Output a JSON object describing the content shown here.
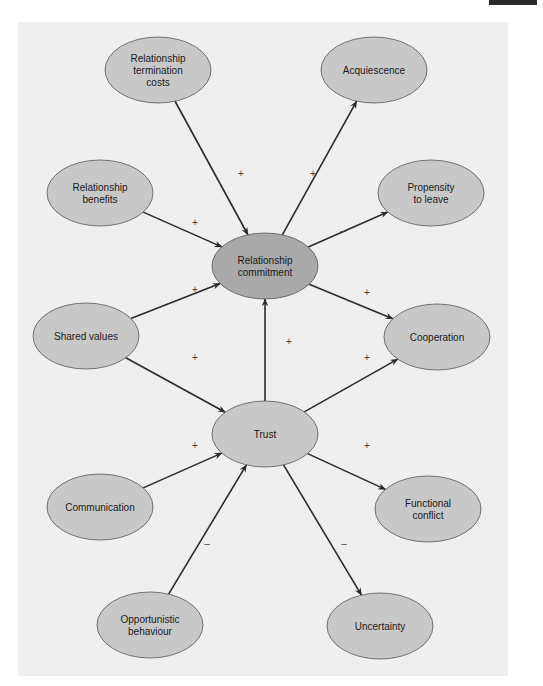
{
  "figure": {
    "type": "causal-path-diagram",
    "colors": {
      "panel_background": "#efefef",
      "node_fill": "#c8c8c8",
      "central_node_fill": "#a9a9a9",
      "node_stroke": "#555555",
      "edge_color": "#2b2b2b"
    },
    "nodes": [
      {
        "id": "termination_costs",
        "lines": [
          "Relationship",
          "termination",
          "costs"
        ],
        "cx": 158,
        "cy": 70,
        "central": false
      },
      {
        "id": "acquiescence",
        "lines": [
          "Acquiescence"
        ],
        "cx": 374,
        "cy": 70,
        "central": false
      },
      {
        "id": "benefits",
        "lines": [
          "Relationship",
          "benefits"
        ],
        "cx": 100,
        "cy": 193,
        "central": false
      },
      {
        "id": "propensity",
        "lines": [
          "Propensity",
          "to leave"
        ],
        "cx": 431,
        "cy": 193,
        "central": false
      },
      {
        "id": "commitment",
        "lines": [
          "Relationship",
          "commitment"
        ],
        "cx": 265,
        "cy": 266,
        "central": true
      },
      {
        "id": "shared_values",
        "lines": [
          "Shared values"
        ],
        "cx": 86,
        "cy": 336,
        "central": false
      },
      {
        "id": "cooperation",
        "lines": [
          "Cooperation"
        ],
        "cx": 437,
        "cy": 337,
        "central": false
      },
      {
        "id": "trust",
        "lines": [
          "Trust"
        ],
        "cx": 265,
        "cy": 434,
        "central": false
      },
      {
        "id": "communication",
        "lines": [
          "Communication"
        ],
        "cx": 100,
        "cy": 507,
        "central": false
      },
      {
        "id": "functional_conflict",
        "lines": [
          "Functional",
          "conflict"
        ],
        "cx": 428,
        "cy": 509,
        "central": false
      },
      {
        "id": "opportunistic",
        "lines": [
          "Opportunistic",
          "behaviour"
        ],
        "cx": 150,
        "cy": 625,
        "central": false
      },
      {
        "id": "uncertainty",
        "lines": [
          "Uncertainty"
        ],
        "cx": 380,
        "cy": 626,
        "central": false
      }
    ],
    "edges": [
      {
        "from": "termination_costs",
        "to": "commitment",
        "sign": "+",
        "lx": 241,
        "ly": 177
      },
      {
        "from": "commitment",
        "to": "acquiescence",
        "sign": "+",
        "lx": 313,
        "ly": 177
      },
      {
        "from": "benefits",
        "to": "commitment",
        "sign": "+",
        "lx": 195,
        "ly": 226
      },
      {
        "from": "commitment",
        "to": "propensity",
        "sign": "–",
        "lx": 343,
        "ly": 234
      },
      {
        "from": "shared_values",
        "to": "commitment",
        "sign": "+",
        "lx": 195,
        "ly": 293
      },
      {
        "from": "commitment",
        "to": "cooperation",
        "sign": "+",
        "lx": 367,
        "ly": 296
      },
      {
        "from": "trust",
        "to": "commitment",
        "sign": "+",
        "lx": 289,
        "ly": 345
      },
      {
        "from": "shared_values",
        "to": "trust",
        "sign": "+",
        "lx": 195,
        "ly": 361
      },
      {
        "from": "trust",
        "to": "cooperation",
        "sign": "+",
        "lx": 367,
        "ly": 361
      },
      {
        "from": "communication",
        "to": "trust",
        "sign": "+",
        "lx": 195,
        "ly": 449
      },
      {
        "from": "trust",
        "to": "functional_conflict",
        "sign": "+",
        "lx": 367,
        "ly": 449
      },
      {
        "from": "opportunistic",
        "to": "trust",
        "sign": "–",
        "lx": 207,
        "ly": 547
      },
      {
        "from": "trust",
        "to": "uncertainty",
        "sign": "–",
        "lx": 344,
        "ly": 547
      }
    ]
  }
}
